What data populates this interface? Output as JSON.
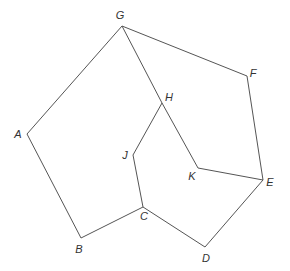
{
  "diagram": {
    "type": "graph",
    "stroke_color": "#555555",
    "label_color": "#333333",
    "vertices": [
      {
        "id": "A",
        "label": "A",
        "x": 27,
        "y": 134,
        "lx": 18,
        "ly": 134
      },
      {
        "id": "B",
        "label": "B",
        "x": 81,
        "y": 238,
        "lx": 79,
        "ly": 249
      },
      {
        "id": "C",
        "label": "C",
        "x": 143,
        "y": 207,
        "lx": 144,
        "ly": 216
      },
      {
        "id": "D",
        "label": "D",
        "x": 205,
        "y": 247,
        "lx": 206,
        "ly": 258
      },
      {
        "id": "E",
        "label": "E",
        "x": 263,
        "y": 180,
        "lx": 270,
        "ly": 182
      },
      {
        "id": "F",
        "label": "F",
        "x": 247,
        "y": 76,
        "lx": 253,
        "ly": 73
      },
      {
        "id": "G",
        "label": "G",
        "x": 122,
        "y": 26,
        "lx": 120,
        "ly": 15
      },
      {
        "id": "H",
        "label": "H",
        "x": 162,
        "y": 103,
        "lx": 169,
        "ly": 97
      },
      {
        "id": "J",
        "label": "J",
        "x": 133,
        "y": 155,
        "lx": 125,
        "ly": 155
      },
      {
        "id": "K",
        "label": "K",
        "x": 198,
        "y": 168,
        "lx": 192,
        "ly": 176
      }
    ],
    "edges": [
      [
        "G",
        "A"
      ],
      [
        "A",
        "B"
      ],
      [
        "B",
        "C"
      ],
      [
        "C",
        "D"
      ],
      [
        "D",
        "E"
      ],
      [
        "E",
        "F"
      ],
      [
        "F",
        "G"
      ],
      [
        "G",
        "H"
      ],
      [
        "H",
        "K"
      ],
      [
        "K",
        "E"
      ],
      [
        "H",
        "J"
      ],
      [
        "J",
        "C"
      ]
    ]
  }
}
